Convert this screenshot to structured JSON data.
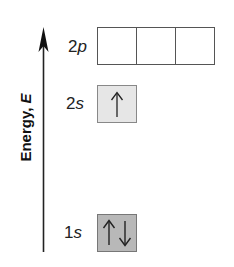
{
  "axis": {
    "label": "Energy, ",
    "variable": "E"
  },
  "levels": [
    {
      "id": "2p",
      "number": "2",
      "subshell": "p",
      "orbitals": [
        {
          "electrons": []
        },
        {
          "electrons": []
        },
        {
          "electrons": []
        }
      ],
      "fill_color": "#ffffff"
    },
    {
      "id": "2s",
      "number": "2",
      "subshell": "s",
      "orbitals": [
        {
          "electrons": [
            "up"
          ]
        }
      ],
      "fill_color": "#e6e6e6"
    },
    {
      "id": "1s",
      "number": "1",
      "subshell": "s",
      "orbitals": [
        {
          "electrons": [
            "up",
            "down"
          ]
        }
      ],
      "fill_color": "#b8b8b8"
    }
  ]
}
